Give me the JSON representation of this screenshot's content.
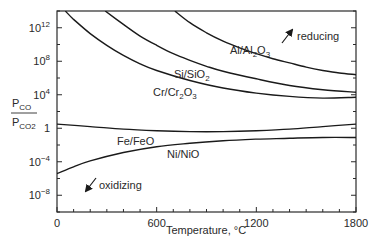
{
  "chart_data": {
    "type": "line",
    "title": "",
    "xlabel": "Temperature, °C",
    "ylabel": "P_CO / P_CO2",
    "ylabel_numerator": "P",
    "ylabel_numerator_sub": "CO",
    "ylabel_denominator": "P",
    "ylabel_denominator_sub": "CO2",
    "xlim": [
      0,
      1800
    ],
    "ylim_log10": [
      -10,
      14
    ],
    "yscale": "log",
    "grid": false,
    "x_ticks": [
      0,
      600,
      1200,
      1800
    ],
    "x_tick_labels": [
      "0",
      "600",
      "1200",
      "1800"
    ],
    "y_ticks_log10": [
      12,
      8,
      4,
      0,
      -4,
      -8
    ],
    "y_tick_labels": [
      {
        "base": "10",
        "exp": "12"
      },
      {
        "base": "10",
        "exp": "8"
      },
      {
        "base": "10",
        "exp": "4"
      },
      {
        "base": "1",
        "exp": ""
      },
      {
        "base": "10",
        "exp": "−4"
      },
      {
        "base": "10",
        "exp": "−8"
      }
    ],
    "series": [
      {
        "name": "Al/Al2O3",
        "label_main": "Al/Al",
        "label_sub": "2",
        "label_tail": "O",
        "label_sub2": "3",
        "x": [
          710,
          800,
          900,
          1000,
          1100,
          1200,
          1300,
          1400,
          1500,
          1600,
          1700,
          1800
        ],
        "log10_y": [
          14.0,
          12.6,
          11.4,
          10.4,
          9.6,
          8.9,
          8.3,
          7.8,
          7.3,
          6.9,
          6.6,
          6.4
        ]
      },
      {
        "name": "Si/SiO2",
        "label_main": "Si/SiO",
        "label_sub": "2",
        "label_tail": "",
        "label_sub2": "",
        "x": [
          290,
          400,
          500,
          600,
          700,
          800,
          900,
          1000,
          1200,
          1400,
          1600,
          1800
        ],
        "log10_y": [
          14.0,
          12.4,
          11.0,
          9.9,
          8.9,
          8.1,
          7.4,
          6.8,
          5.9,
          5.1,
          4.6,
          4.3
        ]
      },
      {
        "name": "Cr/Cr2O3",
        "label_main": "Cr/Cr",
        "label_sub": "2",
        "label_tail": "O",
        "label_sub2": "3",
        "x": [
          50,
          100,
          200,
          300,
          400,
          500,
          600,
          800,
          1000,
          1200,
          1400,
          1600,
          1800
        ],
        "log10_y": [
          14.0,
          13.0,
          11.3,
          9.9,
          8.7,
          7.7,
          6.9,
          5.7,
          4.8,
          4.2,
          3.8,
          3.6,
          3.7
        ]
      },
      {
        "name": "Fe/FeO",
        "label_main": "Fe/FeO",
        "label_sub": "",
        "label_tail": "",
        "label_sub2": "",
        "x": [
          0,
          200,
          400,
          600,
          800,
          1000,
          1200,
          1400,
          1600,
          1800
        ],
        "log10_y": [
          0.5,
          0.2,
          -0.1,
          -0.3,
          -0.4,
          -0.4,
          -0.3,
          -0.1,
          0.2,
          0.5
        ]
      },
      {
        "name": "Ni/NiO",
        "label_main": "Ni/NiO",
        "label_sub": "",
        "label_tail": "",
        "label_sub2": "",
        "x": [
          0,
          100,
          200,
          400,
          600,
          800,
          1000,
          1200,
          1400,
          1600,
          1800
        ],
        "log10_y": [
          -5.4,
          -4.6,
          -3.9,
          -2.9,
          -2.2,
          -1.8,
          -1.5,
          -1.3,
          -1.2,
          -1.1,
          -1.1
        ]
      }
    ],
    "annotations": [
      {
        "text": "reducing",
        "arrow": "up-right"
      },
      {
        "text": "oxidizing",
        "arrow": "down-left"
      }
    ]
  }
}
